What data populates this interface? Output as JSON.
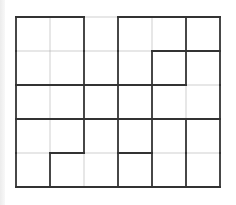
{
  "diagram": {
    "type": "region-partition-grid",
    "rows": 5,
    "cols": 6,
    "cell_size_px": 34,
    "origin_px": [
      16,
      17
    ],
    "colors": {
      "thin_line": "#cfcfcf",
      "thick_line": "#333333",
      "background": "#ffffff"
    },
    "horizontal_edges": [
      [
        1,
        1,
        0,
        1,
        1,
        1
      ],
      [
        0,
        0,
        0,
        0,
        1,
        1
      ],
      [
        1,
        1,
        1,
        1,
        1,
        0
      ],
      [
        1,
        1,
        1,
        1,
        1,
        1
      ],
      [
        0,
        1,
        0,
        1,
        0,
        0
      ],
      [
        1,
        1,
        1,
        1,
        1,
        1
      ]
    ],
    "vertical_edges": [
      [
        1,
        0,
        1,
        1,
        0,
        1,
        1
      ],
      [
        1,
        0,
        1,
        1,
        1,
        1,
        1
      ],
      [
        1,
        0,
        1,
        1,
        1,
        0,
        1
      ],
      [
        1,
        0,
        1,
        1,
        1,
        1,
        1
      ],
      [
        1,
        1,
        0,
        1,
        1,
        1,
        1
      ]
    ]
  }
}
